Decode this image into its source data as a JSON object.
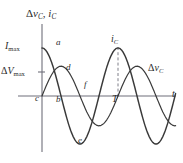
{
  "figure": {
    "title": "",
    "axis_label_y_parts": {
      "delta": "Δ",
      "v": "v",
      "v_sub": "C",
      "comma": ", ",
      "i": "i",
      "i_sub": "C"
    },
    "axis_label_x": "t"
  },
  "labels": {
    "y_axis": "Δv_C, i_C",
    "x_axis": "t",
    "i_max": "I_max",
    "i_max_main": "I",
    "i_max_sub": "max",
    "dv_max_delta": "Δ",
    "dv_max_main": "V",
    "dv_max_sub": "max",
    "curve_current": "i_C",
    "curve_current_main": "i",
    "curve_current_sub": "C",
    "curve_voltage": "Δv_C",
    "curve_voltage_delta": "Δ",
    "curve_voltage_main": "v",
    "curve_voltage_sub": "C",
    "period": "T",
    "point_a": "a",
    "point_b": "b",
    "point_c": "c",
    "point_d": "d",
    "point_e": "e",
    "point_f": "f"
  },
  "colors": {
    "axis": "#6f6f7a",
    "curve": "#3a3a3a",
    "text": "#2b2b2b",
    "background": "#ffffff",
    "dashed": "#6f6f7a"
  },
  "chart_data": {
    "type": "line",
    "title": "",
    "xlabel": "t",
    "ylabel": "Δv_C, i_C",
    "grid": false,
    "legend": "inline-annotations",
    "xlim": [
      0,
      2.25
    ],
    "ylim": [
      -1.15,
      1.15
    ],
    "x_unit": "periods (T)",
    "annotations": [
      {
        "name": "a",
        "text": "a",
        "x": 0.06,
        "y": 0.93,
        "note": "current curve just after maximum at t=0"
      },
      {
        "name": "d",
        "text": "d",
        "x": 0.26,
        "y": 0.6,
        "note": "voltage curve at its maximum ΔV_max"
      },
      {
        "name": "c",
        "text": "c",
        "x": -0.04,
        "y": 0.0,
        "note": "origin, voltage is zero at t=0"
      },
      {
        "name": "b",
        "text": "b",
        "x": 0.26,
        "y": -0.06,
        "note": "current curve crossing zero"
      },
      {
        "name": "f",
        "text": "f",
        "x": 0.62,
        "y": 0.16,
        "note": "voltage curve descending through mid value"
      },
      {
        "name": "e",
        "text": "e",
        "x": 0.5,
        "y": -1.0,
        "note": "current curve minimum"
      },
      {
        "name": "T",
        "text": "T",
        "x": 1.0,
        "y": 0.0,
        "note": "one full period marked on the time axis"
      },
      {
        "name": "i_C",
        "text": "i_C",
        "x": 1.0,
        "y": 1.0,
        "note": "label for the current curve at its peak"
      },
      {
        "name": "Δv_C",
        "text": "Δv_C",
        "x": 1.95,
        "y": 0.72,
        "note": "label for the voltage curve"
      }
    ],
    "y_ticks": [
      {
        "label": "I_max",
        "value": 1.0
      },
      {
        "label": "ΔV_max",
        "value": 0.62
      }
    ],
    "x_ticks": [
      {
        "label": "T",
        "value": 1.0
      }
    ],
    "dashed_guides": [
      {
        "from": [
          1.0,
          1.0
        ],
        "to": [
          1.0,
          0.0
        ],
        "style": "dashed",
        "note": "peak of i_C down to T"
      }
    ],
    "series": [
      {
        "name": "i_C",
        "label": "i_C",
        "form": "cos",
        "amplitude": 1.0,
        "phase_deg": 0,
        "description": "Current through the capacitor leads the voltage by 90 degrees; starts at I_max",
        "x": [
          0,
          0.05,
          0.1,
          0.15,
          0.2,
          0.25,
          0.3,
          0.35,
          0.4,
          0.45,
          0.5,
          0.55,
          0.6,
          0.65,
          0.7,
          0.75,
          0.8,
          0.85,
          0.9,
          0.95,
          1.0,
          1.05,
          1.1,
          1.15,
          1.2,
          1.25,
          1.3,
          1.35,
          1.4,
          1.45,
          1.5,
          1.55,
          1.6,
          1.65,
          1.7,
          1.75,
          1.8,
          1.85,
          1.9,
          1.95,
          2.0,
          2.05,
          2.1,
          2.15,
          2.2,
          2.25
        ],
        "y": [
          1.0,
          0.95,
          0.81,
          0.59,
          0.31,
          0.0,
          -0.31,
          -0.59,
          -0.81,
          -0.95,
          -1.0,
          -0.95,
          -0.81,
          -0.59,
          -0.31,
          0.0,
          0.31,
          0.59,
          0.81,
          0.95,
          1.0,
          0.95,
          0.81,
          0.59,
          0.31,
          0.0,
          -0.31,
          -0.59,
          -0.81,
          -0.95,
          -1.0,
          -0.95,
          -0.81,
          -0.59,
          -0.31,
          0.0,
          0.31,
          0.59,
          0.81,
          0.95,
          1.0,
          0.95,
          0.81,
          0.59,
          0.31,
          0.0
        ]
      },
      {
        "name": "Δv_C",
        "label": "Δv_C",
        "form": "sin",
        "amplitude": 0.62,
        "phase_deg": -90,
        "description": "Voltage across the capacitor lags the current by 90 degrees; starts at zero",
        "x": [
          0,
          0.05,
          0.1,
          0.15,
          0.2,
          0.25,
          0.3,
          0.35,
          0.4,
          0.45,
          0.5,
          0.55,
          0.6,
          0.65,
          0.7,
          0.75,
          0.8,
          0.85,
          0.9,
          0.95,
          1.0,
          1.05,
          1.1,
          1.15,
          1.2,
          1.25,
          1.3,
          1.35,
          1.4,
          1.45,
          1.5,
          1.55,
          1.6,
          1.65,
          1.7,
          1.75,
          1.8,
          1.85,
          1.9,
          1.95,
          2.0,
          2.05,
          2.1,
          2.15,
          2.2,
          2.25
        ],
        "y": [
          0.0,
          0.19,
          0.36,
          0.5,
          0.59,
          0.62,
          0.59,
          0.5,
          0.36,
          0.19,
          0.0,
          -0.19,
          -0.36,
          -0.5,
          -0.59,
          -0.62,
          -0.59,
          -0.5,
          -0.36,
          -0.19,
          0.0,
          0.19,
          0.36,
          0.5,
          0.59,
          0.62,
          0.59,
          0.5,
          0.36,
          0.19,
          0.0,
          -0.19,
          -0.36,
          -0.5,
          -0.59,
          -0.62,
          -0.59,
          -0.5,
          -0.36,
          -0.19,
          0.0,
          0.19,
          0.36,
          0.5,
          0.59,
          0.62
        ]
      }
    ]
  }
}
